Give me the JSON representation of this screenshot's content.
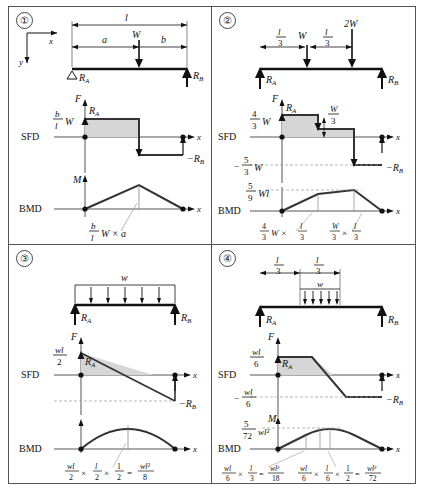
{
  "figure": {
    "axes_legend": {
      "x_axis": "x",
      "y_axis": "y"
    },
    "row_labels": {
      "sfd": "SFD",
      "bmd": "BMD"
    },
    "symbols": {
      "F": "F",
      "M": "M",
      "x": "x",
      "RA": "R",
      "RB": "R",
      "RA_sub": "A",
      "RB_sub": "B",
      "neg_RB": "−R",
      "W": "W",
      "w": "w",
      "l": "l"
    }
  },
  "panels": [
    {
      "number": "①",
      "id": "panel-1",
      "beam": {
        "load_type": "single point load",
        "dimensions": [
          "l",
          "a",
          "b"
        ],
        "loads": [
          {
            "label": "W",
            "position": "a from A"
          }
        ],
        "reactions": [
          "R_A",
          "R_B"
        ],
        "support_left": "pin-triangle",
        "support_right": "arrow"
      },
      "sfd": {
        "peak_label_num": "b",
        "peak_label_den": "l",
        "peak_label_tail": "W",
        "ra_label": "R",
        "ra_sub": "A",
        "neg_label": "−R",
        "neg_sub": "B",
        "axis_y": "F",
        "axis_x": "x"
      },
      "bmd": {
        "axis_y": "M",
        "axis_x": "x",
        "formula": {
          "num": "b",
          "den": "l",
          "tail": "W × a"
        }
      }
    },
    {
      "number": "②",
      "id": "panel-2",
      "beam": {
        "load_type": "two point loads",
        "dimensions": [
          "l/3",
          "l/3"
        ],
        "loads": [
          {
            "label": "W"
          },
          {
            "label": "2W"
          }
        ],
        "reactions": [
          "R_A",
          "R_B"
        ]
      },
      "sfd": {
        "peak_num": "4",
        "peak_den": "3",
        "peak_tail": "W",
        "step_num": "W",
        "step_den": "3",
        "min_sign": "−",
        "min_num": "5",
        "min_den": "3",
        "min_tail": "W",
        "ra_label": "R",
        "ra_sub": "A",
        "neg_label": "−R",
        "neg_sub": "B",
        "axis_y": "F",
        "axis_x": "x"
      },
      "bmd": {
        "axis_x": "x",
        "peak_num": "5",
        "peak_den": "9",
        "peak_tail": "Wl",
        "formula_left": {
          "num": "4",
          "den": "3",
          "tail": "W ×",
          "num2": "l",
          "den2": "3"
        },
        "formula_right": {
          "num": "W",
          "den": "3",
          "tail": "×",
          "num2": "l",
          "den2": "3"
        }
      }
    },
    {
      "number": "③",
      "id": "panel-3",
      "beam": {
        "load_type": "uniformly distributed load full span",
        "load_label": "w",
        "reactions": [
          "R_A",
          "R_B"
        ]
      },
      "sfd": {
        "peak_num": "wl",
        "peak_den": "2",
        "ra_label": "R",
        "ra_sub": "A",
        "neg_label": "−R",
        "neg_sub": "B",
        "axis_y": "F",
        "axis_x": "x"
      },
      "bmd": {
        "axis_x": "x",
        "formula": {
          "t1_num": "wl",
          "t1_den": "2",
          "op1": "×",
          "t2_num": "l",
          "t2_den": "2",
          "op2": "×",
          "t3_num": "1",
          "t3_den": "2",
          "eq": "=",
          "t4_num": "wl²",
          "t4_den": "8"
        }
      }
    },
    {
      "number": "④",
      "id": "panel-4",
      "beam": {
        "load_type": "partial uniformly distributed load on middle third",
        "dimensions": [
          "l/3",
          "l/3"
        ],
        "load_label": "w",
        "reactions": [
          "R_A",
          "R_B"
        ]
      },
      "sfd": {
        "peak_num": "wl",
        "peak_den": "6",
        "min_sign": "−",
        "min_num": "wl",
        "min_den": "6",
        "ra_label": "R",
        "ra_sub": "A",
        "neg_label": "−R",
        "neg_sub": "B",
        "axis_y": "F",
        "axis_x": "x"
      },
      "bmd": {
        "axis_y": "M",
        "axis_x": "x",
        "peak_num": "5",
        "peak_den": "72",
        "peak_tail": "wl²",
        "formula_left": {
          "t1_num": "wl",
          "t1_den": "6",
          "op1": "×",
          "t2_num": "l",
          "t2_den": "3",
          "eq": "=",
          "t3_num": "wl²",
          "t3_den": "18"
        },
        "formula_right": {
          "t1_num": "wl",
          "t1_den": "6",
          "op1": "×",
          "t2_num": "l",
          "t2_den": "6",
          "op2": "×",
          "t3_num": "1",
          "t3_den": "2",
          "eq": "=",
          "t4_num": "wl²",
          "t4_den": "72"
        }
      }
    }
  ]
}
